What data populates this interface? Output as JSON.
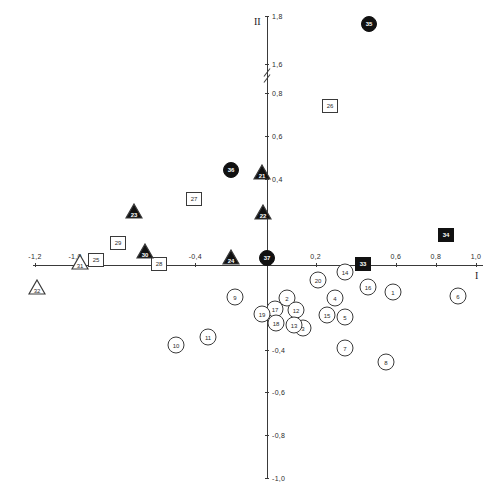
{
  "chart_data": {
    "type": "scatter",
    "title": "",
    "xlabel": "I",
    "ylabel": "II",
    "xlim": [
      -1.2,
      1.0
    ],
    "ylim": [
      -1.0,
      1.8
    ],
    "grid": false,
    "legend": "none",
    "axis_break": {
      "axis": "y",
      "between": [
        0.8,
        1.6
      ]
    },
    "xticks": [
      {
        "value": -1.2,
        "label": "-1,2"
      },
      {
        "value": -1.0,
        "label": "-1,0"
      },
      {
        "value": -0.4,
        "label": "-0,4"
      },
      {
        "value": 0.2,
        "label": "0,2"
      },
      {
        "value": 0.6,
        "label": "0,6"
      },
      {
        "value": 0.8,
        "label": "0,8"
      },
      {
        "value": 1.0,
        "label": "1,0"
      }
    ],
    "yticks": [
      {
        "value": 1.8,
        "label": "1,8"
      },
      {
        "value": 1.6,
        "label": "1,6"
      },
      {
        "value": 0.8,
        "label": "0,8"
      },
      {
        "value": 0.6,
        "label": "0,6"
      },
      {
        "value": 0.4,
        "label": "0,4"
      },
      {
        "value": -0.4,
        "label": "-0,4"
      },
      {
        "value": -0.6,
        "label": "-0,6"
      },
      {
        "value": -0.8,
        "label": "-0,8"
      },
      {
        "value": -1.0,
        "label": "-1,0"
      }
    ],
    "marker_styles": {
      "circle_open": "open circle",
      "circle_filled": "filled circle",
      "square_open": "open square",
      "square_filled": "filled square",
      "triangle_open": "open triangle",
      "triangle_filled": "filled triangle"
    },
    "points": [
      {
        "label": "1",
        "shape": "circle",
        "fill": "open",
        "px": 393,
        "py": 292
      },
      {
        "label": "2",
        "shape": "circle",
        "fill": "open",
        "px": 287,
        "py": 298
      },
      {
        "label": "3",
        "shape": "circle",
        "fill": "open",
        "px": 303,
        "py": 328
      },
      {
        "label": "4",
        "shape": "circle",
        "fill": "open",
        "px": 335,
        "py": 298
      },
      {
        "label": "5",
        "shape": "circle",
        "fill": "open",
        "px": 345,
        "py": 317
      },
      {
        "label": "6",
        "shape": "circle",
        "fill": "open",
        "px": 458,
        "py": 296
      },
      {
        "label": "7",
        "shape": "circle",
        "fill": "open",
        "px": 345,
        "py": 348
      },
      {
        "label": "8",
        "shape": "circle",
        "fill": "open",
        "px": 386,
        "py": 362
      },
      {
        "label": "9",
        "shape": "circle",
        "fill": "open",
        "px": 235,
        "py": 297
      },
      {
        "label": "10",
        "shape": "circle",
        "fill": "open",
        "px": 176,
        "py": 345
      },
      {
        "label": "11",
        "shape": "circle",
        "fill": "open",
        "px": 208,
        "py": 337
      },
      {
        "label": "12",
        "shape": "circle",
        "fill": "open",
        "px": 296,
        "py": 310
      },
      {
        "label": "13",
        "shape": "circle",
        "fill": "open",
        "px": 294,
        "py": 325
      },
      {
        "label": "14",
        "shape": "circle",
        "fill": "open",
        "px": 345,
        "py": 272
      },
      {
        "label": "15",
        "shape": "circle",
        "fill": "open",
        "px": 327,
        "py": 315
      },
      {
        "label": "16",
        "shape": "circle",
        "fill": "open",
        "px": 368,
        "py": 287
      },
      {
        "label": "17",
        "shape": "circle",
        "fill": "open",
        "px": 275,
        "py": 309
      },
      {
        "label": "18",
        "shape": "circle",
        "fill": "open",
        "px": 276,
        "py": 323
      },
      {
        "label": "19",
        "shape": "circle",
        "fill": "open",
        "px": 262,
        "py": 314
      },
      {
        "label": "20",
        "shape": "circle",
        "fill": "open",
        "px": 318,
        "py": 280
      },
      {
        "label": "21",
        "shape": "triangle",
        "fill": "filled",
        "px": 262,
        "py": 172
      },
      {
        "label": "22",
        "shape": "triangle",
        "fill": "filled",
        "px": 263,
        "py": 212
      },
      {
        "label": "23",
        "shape": "triangle",
        "fill": "filled",
        "px": 134,
        "py": 211
      },
      {
        "label": "24",
        "shape": "triangle",
        "fill": "filled",
        "px": 231,
        "py": 257
      },
      {
        "label": "25",
        "shape": "square",
        "fill": "open",
        "px": 96,
        "py": 260
      },
      {
        "label": "26",
        "shape": "square",
        "fill": "open",
        "px": 330,
        "py": 106
      },
      {
        "label": "27",
        "shape": "square",
        "fill": "open",
        "px": 194,
        "py": 199
      },
      {
        "label": "28",
        "shape": "square",
        "fill": "open",
        "px": 159,
        "py": 264
      },
      {
        "label": "29",
        "shape": "square",
        "fill": "open",
        "px": 118,
        "py": 243
      },
      {
        "label": "30",
        "shape": "triangle",
        "fill": "filled",
        "px": 145,
        "py": 251
      },
      {
        "label": "31",
        "shape": "triangle",
        "fill": "open",
        "px": 80,
        "py": 262
      },
      {
        "label": "32",
        "shape": "triangle",
        "fill": "open",
        "px": 37,
        "py": 287
      },
      {
        "label": "33",
        "shape": "square",
        "fill": "filled",
        "px": 363,
        "py": 264
      },
      {
        "label": "34",
        "shape": "square",
        "fill": "filled",
        "px": 446,
        "py": 235
      },
      {
        "label": "35",
        "shape": "circle",
        "fill": "filled",
        "px": 369,
        "py": 24
      },
      {
        "label": "36",
        "shape": "circle",
        "fill": "filled",
        "px": 231,
        "py": 170
      },
      {
        "label": "37",
        "shape": "circle",
        "fill": "filled",
        "px": 267,
        "py": 258
      }
    ]
  },
  "geometry": {
    "origin_px": 267,
    "origin_py": 265,
    "x_axis_left": 33,
    "x_axis_right": 483,
    "y_axis_top": 16,
    "y_axis_bottom": 478
  }
}
